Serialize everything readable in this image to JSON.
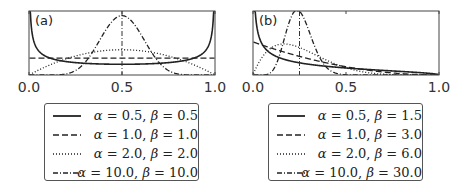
{
  "chart_data": [
    {
      "type": "line",
      "title": "(a)",
      "xlabel": "",
      "ylabel": "",
      "xlim": [
        0.0,
        1.0
      ],
      "x_ticks": [
        "0.0",
        "0.5",
        "1.0"
      ],
      "y_ticks": [],
      "grid": false,
      "legend_position": "below",
      "series": [
        {
          "name": "α = 0.5, β = 0.5",
          "alpha": 0.5,
          "beta": 0.5,
          "style": "solid"
        },
        {
          "name": "α = 1.0, β = 1.0",
          "alpha": 1.0,
          "beta": 1.0,
          "style": "dashed"
        },
        {
          "name": "α = 2.0, β = 2.0",
          "alpha": 2.0,
          "beta": 2.0,
          "style": "dotted"
        },
        {
          "name": "α = 10.0, β = 10.0",
          "alpha": 10.0,
          "beta": 10.0,
          "style": "dashdot"
        }
      ],
      "annotations": [
        "vertical dash-dot line at x = 0.5 (mean)"
      ]
    },
    {
      "type": "line",
      "title": "(b)",
      "xlabel": "",
      "ylabel": "",
      "xlim": [
        0.0,
        1.0
      ],
      "x_ticks": [
        "0.0",
        "0.5",
        "1.0"
      ],
      "y_ticks": [],
      "grid": false,
      "legend_position": "below",
      "series": [
        {
          "name": "α = 0.5, β = 1.5",
          "alpha": 0.5,
          "beta": 1.5,
          "style": "solid"
        },
        {
          "name": "α = 1.0, β = 3.0",
          "alpha": 1.0,
          "beta": 3.0,
          "style": "dashed"
        },
        {
          "name": "α = 2.0, β = 6.0",
          "alpha": 2.0,
          "beta": 6.0,
          "style": "dotted"
        },
        {
          "name": "α = 10.0, β = 30.0",
          "alpha": 10.0,
          "beta": 30.0,
          "style": "dashdot"
        }
      ],
      "annotations": [
        "vertical dash-dot line at x = 0.25 (mean)"
      ]
    }
  ],
  "panels": [
    {
      "label": "(a)",
      "ticks": [
        "0.0",
        "0.5",
        "1.0"
      ],
      "legend": [
        {
          "a": "0.5",
          "b": "0.5"
        },
        {
          "a": "1.0",
          "b": "1.0"
        },
        {
          "a": "2.0",
          "b": "2.0"
        },
        {
          "a": "10.0",
          "b": "10.0"
        }
      ]
    },
    {
      "label": "(b)",
      "ticks": [
        "0.0",
        "0.5",
        "1.0"
      ],
      "legend": [
        {
          "a": "0.5",
          "b": "1.5"
        },
        {
          "a": "1.0",
          "b": "3.0"
        },
        {
          "a": "2.0",
          "b": "6.0"
        },
        {
          "a": "10.0",
          "b": "30.0"
        }
      ]
    }
  ],
  "symbols": {
    "alpha": "α",
    "beta": "β",
    "eq": " = ",
    "sep": ", "
  },
  "colors": {
    "line": "#222222",
    "frame": "#444444",
    "mean_line": "#333333"
  }
}
